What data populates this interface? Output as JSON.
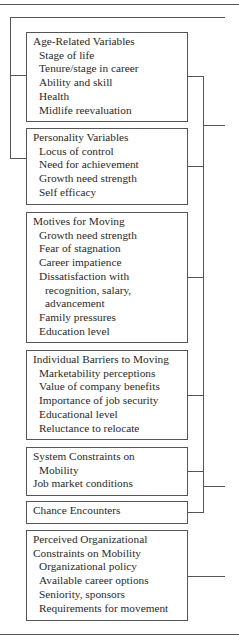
{
  "diagram": {
    "boxes": [
      {
        "title": "Age-Related Variables",
        "items": [
          "Stage of life",
          "Tenure/stage in career",
          "Ability and skill",
          "Health",
          "Midlife reevaluation"
        ]
      },
      {
        "title": "Personality Variables",
        "items": [
          "Locus of control",
          "Need for achievement",
          "Growth need strength",
          "Self efficacy"
        ]
      },
      {
        "title": "Motives for Moving",
        "items": [
          "Growth need strength",
          "Fear of stagnation",
          "Career impatience",
          "Dissatisfaction with"
        ],
        "subitems": [
          "recognition, salary,",
          "advancement"
        ],
        "items_after": [
          "Family pressures",
          "Education level"
        ]
      },
      {
        "title": "Individual Barriers to Moving",
        "items": [
          "Marketability perceptions",
          "Value of company benefits",
          "Importance of job security",
          "Educational level",
          "Reluctance to relocate"
        ]
      },
      {
        "title": "System Constraints on",
        "title_cont": "Mobility",
        "title_after": "Job market conditions"
      },
      {
        "title": "Chance Encounters"
      },
      {
        "title": "Perceived Organizational",
        "title_cont": "Constraints on Mobility",
        "items": [
          "Organizational policy",
          "Available career options",
          "Seniority, sponsors",
          "Requirements for movement"
        ]
      }
    ],
    "colors": {
      "line": "#555555",
      "text": "#2a2a2a",
      "background": "#ffffff"
    }
  }
}
